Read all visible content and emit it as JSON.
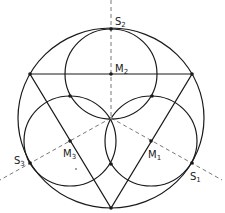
{
  "diagram": {
    "colors": {
      "stroke": "#1a1a1a",
      "dashed": "#555555",
      "background": "#ffffff"
    },
    "outer_circle": {
      "cx": 111,
      "cy": 118,
      "rx": 93,
      "ry": 90
    },
    "inner_circles": [
      {
        "name": "M2",
        "cx": 111,
        "cy": 74,
        "r": 45
      },
      {
        "name": "M3",
        "cx": 70,
        "cy": 141,
        "r": 45
      },
      {
        "name": "M1",
        "cx": 151,
        "cy": 141,
        "r": 45
      }
    ],
    "triangle": {
      "points": [
        [
          30,
          74
        ],
        [
          192,
          74
        ],
        [
          111,
          208
        ]
      ]
    },
    "dashed_axes": [
      {
        "from": [
          111,
          0
        ],
        "to": [
          111,
          118
        ]
      },
      {
        "from": [
          111,
          118
        ],
        "to": [
          0,
          180
        ]
      },
      {
        "from": [
          111,
          118
        ],
        "to": [
          222,
          180
        ]
      }
    ],
    "points": [
      {
        "name": "S2",
        "x": 111,
        "y": 29
      },
      {
        "name": "M2",
        "x": 111,
        "y": 74
      },
      {
        "name": "M3",
        "x": 70,
        "y": 141
      },
      {
        "name": "M1",
        "x": 151,
        "y": 141
      },
      {
        "name": "S3",
        "x": 30,
        "y": 163
      },
      {
        "name": "S1",
        "x": 192,
        "y": 163
      },
      {
        "name": "vertex-left",
        "x": 30,
        "y": 74
      },
      {
        "name": "vertex-right",
        "x": 192,
        "y": 74
      },
      {
        "name": "vertex-bottom",
        "x": 111,
        "y": 208
      },
      {
        "name": "intersection-left",
        "x": 70,
        "y": 96
      },
      {
        "name": "intersection-right",
        "x": 152,
        "y": 96
      },
      {
        "name": "intersection-bottom",
        "x": 111,
        "y": 164
      },
      {
        "name": "center",
        "x": 111,
        "y": 118
      }
    ],
    "labels": {
      "S2": {
        "base": "S",
        "sub": "2"
      },
      "M2": {
        "base": "M",
        "sub": "2"
      },
      "M3": {
        "base": "M",
        "sub": "3"
      },
      "M1": {
        "base": "M",
        "sub": "1"
      },
      "S3": {
        "base": "S",
        "sub": "3"
      },
      "S1": {
        "base": "S",
        "sub": "1"
      }
    }
  }
}
